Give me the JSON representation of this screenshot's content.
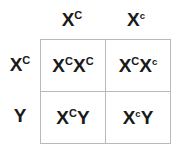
{
  "diagram": {
    "type": "punnett-square",
    "title": "",
    "grid_border_color": "#b9b9b9",
    "text_color": "#1a1a1a",
    "background_color": "#ffffff",
    "column_headers": [
      {
        "base": "X",
        "superscript": "C",
        "case": "upper",
        "full": "Xᶜ"
      },
      {
        "base": "X",
        "superscript": "c",
        "case": "lower",
        "full": "Xᶜ"
      }
    ],
    "row_headers": [
      {
        "base": "X",
        "superscript": "C",
        "case": "upper",
        "full": "Xᶜ"
      },
      {
        "base": "Y",
        "superscript": "",
        "case": "none",
        "full": "Y"
      }
    ],
    "cells": [
      [
        {
          "parts": [
            {
              "base": "X",
              "superscript": "C",
              "case": "upper"
            },
            {
              "base": "X",
              "superscript": "C",
              "case": "upper"
            }
          ],
          "text": "XCXC"
        },
        {
          "parts": [
            {
              "base": "X",
              "superscript": "C",
              "case": "upper"
            },
            {
              "base": "X",
              "superscript": "c",
              "case": "lower"
            }
          ],
          "text": "XCXc"
        }
      ],
      [
        {
          "parts": [
            {
              "base": "X",
              "superscript": "C",
              "case": "upper"
            },
            {
              "base": "Y",
              "superscript": "",
              "case": "none"
            }
          ],
          "text": "XCY"
        },
        {
          "parts": [
            {
              "base": "X",
              "superscript": "c",
              "case": "lower"
            },
            {
              "base": "Y",
              "superscript": "",
              "case": "none"
            }
          ],
          "text": "XcY"
        }
      ]
    ]
  }
}
